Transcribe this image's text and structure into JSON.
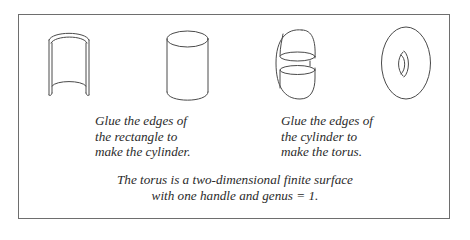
{
  "diagram": {
    "figures": [
      {
        "id": "open-rectangle",
        "label": "curved rectangle (open sheet)"
      },
      {
        "id": "cylinder",
        "label": "cylinder"
      },
      {
        "id": "glued-cylinder",
        "label": "cylinder bent to glue its ends"
      },
      {
        "id": "torus",
        "label": "torus"
      }
    ],
    "captions": {
      "left": {
        "lines": [
          "Glue the edges of",
          "the rectangle to",
          "make the cylinder."
        ]
      },
      "right": {
        "lines": [
          "Glue the edges of",
          "the cylinder to",
          "make the torus."
        ]
      },
      "bottom": {
        "lines": [
          "The torus is a two-dimensional finite surface",
          "with one handle and genus = 1."
        ]
      }
    },
    "colors": {
      "stroke": "#4a4a4a",
      "frame": "#6e6e6e",
      "text": "#2b2b2b",
      "background": "#ffffff"
    }
  }
}
